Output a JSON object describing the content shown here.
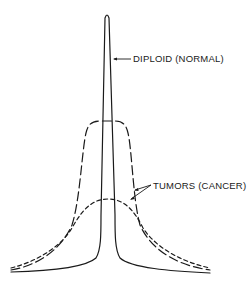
{
  "diagram": {
    "title": "",
    "labels": {
      "normal": "DIPLOID (NORMAL)",
      "tumors": "TUMORS (CANCER)"
    },
    "curves": [
      {
        "name": "diploid-normal",
        "style": "solid",
        "description": "tall narrow peak"
      },
      {
        "name": "tumor-broad-plateau",
        "style": "long-dash",
        "description": "medium-height flat-topped curve"
      },
      {
        "name": "tumor-low-broad",
        "style": "short-dash",
        "description": "low broad curve"
      }
    ],
    "colors": {
      "line": "#1a1a1a",
      "background": "#ffffff"
    }
  }
}
